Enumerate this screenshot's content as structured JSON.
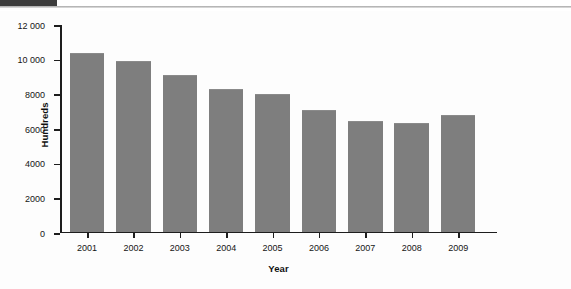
{
  "header": {
    "dark_block_color": "#3d3d3d",
    "rule_color": "#b5b5b5"
  },
  "figure": {
    "background_color": "#fdfdfd",
    "bar_color": "#7e7e7e",
    "axis_color": "#1d1d1d"
  },
  "chart_data": {
    "type": "bar",
    "title": "",
    "subtitle": "",
    "xlabel": "Year",
    "ylabel": "Hundreds",
    "categories": [
      "2001",
      "2002",
      "2003",
      "2004",
      "2005",
      "2006",
      "2007",
      "2008",
      "2009"
    ],
    "values": [
      10270,
      9800,
      8990,
      8170,
      7880,
      6960,
      6320,
      6200,
      6670
    ],
    "series": [
      {
        "name": "Hundreds",
        "values": [
          10270,
          9800,
          8990,
          8170,
          7880,
          6960,
          6320,
          6200,
          6670
        ]
      }
    ],
    "ylim": [
      0,
      12000
    ],
    "ytick_values": [
      0,
      2000,
      4000,
      6000,
      8000,
      10000,
      12000
    ],
    "ytick_labels": [
      "0",
      "2000",
      "4000",
      "6000",
      "8000",
      "10 000",
      "12 000"
    ],
    "xtick_labels": [
      "2001",
      "2002",
      "2003",
      "2004",
      "2005",
      "2006",
      "2007",
      "2008",
      "2009"
    ],
    "grid": false,
    "legend": null,
    "legend_position": "none",
    "annotations": [],
    "bar_color": "#7e7e7e"
  }
}
